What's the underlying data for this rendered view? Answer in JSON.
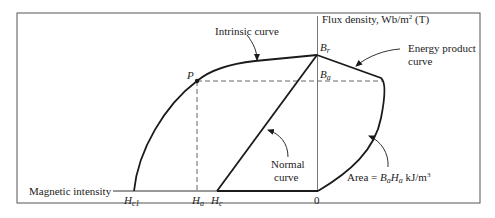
{
  "diagram": {
    "type": "demagnetization-curve",
    "colors": {
      "stroke": "#1a1a1a",
      "frame": "#555555",
      "axis": "#777777",
      "dashed": "#666666",
      "background": "#ffffff"
    },
    "axes": {
      "y_label": "Flux density, Wb/m",
      "y_label_sup": "2",
      "y_label_unit": " (T)",
      "x_label": "Magnetic intensity"
    },
    "points": {
      "Br": {
        "main": "B",
        "sub": "r"
      },
      "Ba": {
        "main": "B",
        "sub": "a"
      },
      "P": {
        "main": "P"
      },
      "Hc1": {
        "main": "H",
        "sub": "c1"
      },
      "Ha": {
        "main": "H",
        "sub": "a"
      },
      "Hc": {
        "main": "H",
        "sub": "c"
      },
      "origin": "0"
    },
    "annotations": {
      "intrinsic_curve": "Intrinsic curve",
      "energy_product_line1": "Energy product",
      "energy_product_line2": "curve",
      "normal_curve_line1": "Normal",
      "normal_curve_line2": "curve",
      "area_prefix": "Area = ",
      "area_B": "B",
      "area_B_sub": "a",
      "area_H": "H",
      "area_H_sub": "a",
      "area_unit": " kJ/m",
      "area_unit_sup": "3"
    }
  }
}
